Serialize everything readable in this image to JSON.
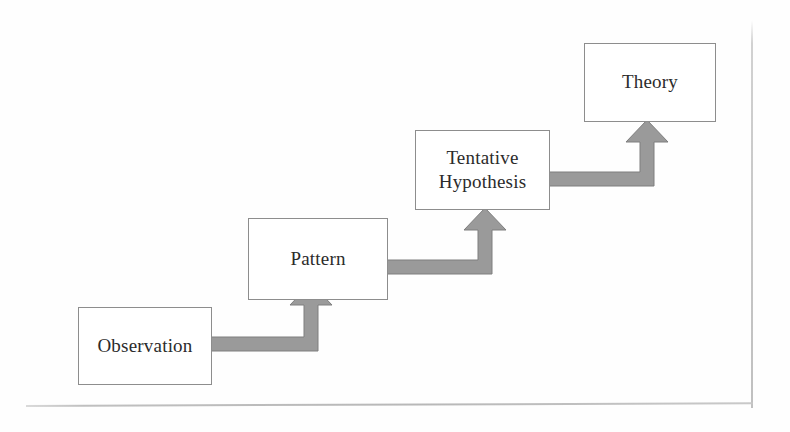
{
  "diagram": {
    "type": "flowchart",
    "orientation": "ascending-staircase",
    "colors": {
      "box_border": "#8d8d8d",
      "box_fill": "#ffffff",
      "arrow_fill": "#9a9a9a",
      "arrow_stroke": "#7e7e7e",
      "text": "#2b2b2b",
      "page_edge": "#bdbdbd"
    },
    "nodes": [
      {
        "id": "observation",
        "label": "Observation",
        "step": 1,
        "x": 78,
        "y": 307,
        "w": 134,
        "h": 78
      },
      {
        "id": "pattern",
        "label": "Pattern",
        "step": 2,
        "x": 248,
        "y": 218,
        "w": 140,
        "h": 82
      },
      {
        "id": "hypothesis",
        "label": "Tentative\nHypothesis",
        "step": 3,
        "x": 415,
        "y": 130,
        "w": 135,
        "h": 80
      },
      {
        "id": "theory",
        "label": "Theory",
        "step": 4,
        "x": 584,
        "y": 43,
        "w": 132,
        "h": 79
      }
    ],
    "connectors": [
      {
        "id": "observation-to-pattern",
        "from": "Observation",
        "to": "Pattern",
        "shape": "elbow-right-then-up"
      },
      {
        "id": "pattern-to-hypothesis",
        "from": "Pattern",
        "to": "Tentative Hypothesis",
        "shape": "elbow-right-then-up"
      },
      {
        "id": "hypothesis-to-theory",
        "from": "Tentative Hypothesis",
        "to": "Theory",
        "shape": "elbow-right-then-up"
      }
    ]
  }
}
